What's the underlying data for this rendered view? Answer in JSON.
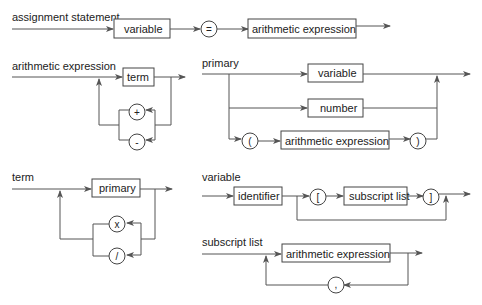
{
  "diagrams": {
    "assignment": {
      "title": "assignment statement",
      "nodes": {
        "variable": "variable",
        "equals": "=",
        "expr": "arithmetic expression"
      }
    },
    "arith": {
      "title": "arithmetic expression",
      "nodes": {
        "term": "term",
        "plus": "+",
        "minus": "-"
      }
    },
    "primary": {
      "title": "primary",
      "nodes": {
        "variable": "variable",
        "number": "number",
        "lparen": "(",
        "expr": "arithmetic expression",
        "rparen": ")"
      }
    },
    "term": {
      "title": "term",
      "nodes": {
        "primary": "primary",
        "times": "x",
        "divide": "/"
      }
    },
    "variable": {
      "title": "variable",
      "nodes": {
        "identifier": "identifier",
        "lbracket": "[",
        "subscript": "subscript list",
        "rbracket": "]"
      }
    },
    "subscript": {
      "title": "subscript list",
      "nodes": {
        "expr": "arithmetic expression",
        "comma": ","
      }
    }
  }
}
